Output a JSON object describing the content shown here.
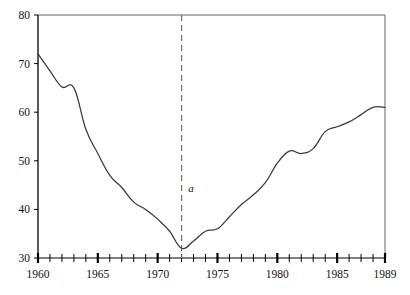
{
  "chart_data": {
    "type": "line",
    "title": "",
    "subtitle": "",
    "xlabel": "",
    "ylabel": "",
    "xlim": [
      1960,
      1989
    ],
    "ylim": [
      30,
      80
    ],
    "grid": false,
    "legend": null,
    "y_ticks": [
      30,
      40,
      50,
      60,
      70,
      80
    ],
    "y_tick_labels": [
      "30",
      "40",
      "50",
      "60",
      "70",
      "80"
    ],
    "x_ticks": [
      1960,
      1961,
      1962,
      1963,
      1964,
      1965,
      1966,
      1967,
      1968,
      1969,
      1970,
      1971,
      1972,
      1973,
      1974,
      1975,
      1976,
      1977,
      1978,
      1979,
      1980,
      1981,
      1982,
      1983,
      1984,
      1985,
      1986,
      1987,
      1988,
      1989
    ],
    "x_tick_labels_shown": [
      "1960",
      "1965",
      "1970",
      "1975",
      "1980",
      "1985",
      "1989"
    ],
    "x_major_ticks": [
      1960,
      1965,
      1970,
      1975,
      1980,
      1985,
      1989
    ],
    "x": [
      1960,
      1961,
      1962,
      1963,
      1964,
      1965,
      1966,
      1967,
      1968,
      1969,
      1970,
      1971,
      1972,
      1973,
      1974,
      1975,
      1976,
      1977,
      1978,
      1979,
      1980,
      1981,
      1982,
      1983,
      1984,
      1985,
      1986,
      1987,
      1988,
      1989
    ],
    "values": [
      72.0,
      68.5,
      65.2,
      65.0,
      56.5,
      51.5,
      47.0,
      44.5,
      41.5,
      40.0,
      38.0,
      35.5,
      32.0,
      33.5,
      35.5,
      36.0,
      38.5,
      41.0,
      43.0,
      45.5,
      49.5,
      52.0,
      51.5,
      52.5,
      56.0,
      57.0,
      58.0,
      59.5,
      61.0,
      61.0
    ],
    "series_name": "",
    "annotations": [
      {
        "name": "a",
        "label": "a",
        "x": 1972,
        "type": "vertical-dashed-line",
        "label_x": 1972.4,
        "label_y": 43.5,
        "note": "marks series minimum at 1972"
      }
    ],
    "axis_color": "#000000",
    "series_color": "#3a3a3a",
    "marker_color": "#6b6b6b",
    "background": "#ffffff"
  }
}
